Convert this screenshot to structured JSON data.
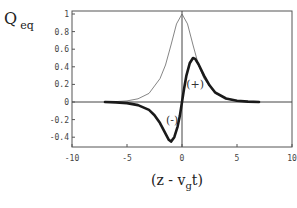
{
  "chart_data": {
    "type": "line",
    "title": "",
    "xlabel": "(z - v_g t)",
    "ylabel": "Q_eq",
    "xlim": [
      -10,
      10
    ],
    "ylim": [
      -0.5,
      1.05
    ],
    "x_ticks": [
      "-10",
      "-5",
      "0",
      "5",
      "10"
    ],
    "y_ticks": [
      "1",
      "0.8",
      "0.6",
      "0.4",
      "0.2",
      "0",
      "-0.2",
      "-0.4"
    ],
    "grid": false,
    "legend": null,
    "annotations": [
      {
        "text": "(+)",
        "x": 1.2,
        "y": 0.2
      },
      {
        "text": "(-)",
        "x": -0.9,
        "y": -0.2
      }
    ],
    "series": [
      {
        "name": "envelope (thin)",
        "style": "thin",
        "x": [
          -7,
          -6,
          -5,
          -4,
          -3,
          -2,
          -1.5,
          -1,
          -0.5,
          0,
          0.5,
          1,
          1.5,
          2,
          3,
          4,
          5,
          6,
          7
        ],
        "values": [
          0.0,
          0.005,
          0.013,
          0.036,
          0.098,
          0.266,
          0.42,
          0.648,
          0.887,
          1.0,
          0.887,
          0.648,
          0.42,
          0.266,
          0.098,
          0.036,
          0.013,
          0.005,
          0.0
        ]
      },
      {
        "name": "Q_eq (thick)",
        "style": "thick",
        "x": [
          -7,
          -6,
          -5,
          -4,
          -3,
          -2.5,
          -2,
          -1.5,
          -1.2,
          -1,
          -0.7,
          -0.4,
          -0.2,
          0,
          0.2,
          0.4,
          0.7,
          1,
          1.2,
          1.5,
          2,
          2.5,
          3,
          4,
          5,
          6,
          7
        ],
        "values": [
          0.0,
          -0.005,
          -0.013,
          -0.035,
          -0.09,
          -0.15,
          -0.24,
          -0.36,
          -0.43,
          -0.45,
          -0.4,
          -0.28,
          -0.16,
          0.0,
          0.16,
          0.3,
          0.44,
          0.5,
          0.49,
          0.43,
          0.3,
          0.19,
          0.11,
          0.04,
          0.015,
          0.005,
          0.0
        ]
      }
    ]
  },
  "labels": {
    "y_main": "Q",
    "y_sub": "eq",
    "x_prefix": "(z - v",
    "x_sub": "g",
    "x_suffix": "t)"
  }
}
